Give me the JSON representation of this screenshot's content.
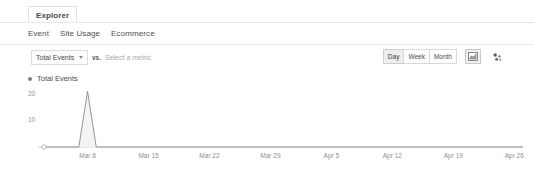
{
  "panel": {
    "main_tab": "Explorer"
  },
  "subtabs": [
    {
      "label": "Event"
    },
    {
      "label": "Site Usage"
    },
    {
      "label": "Ecommerce"
    }
  ],
  "controls": {
    "metric_select_value": "Total Events",
    "vs_label": "vs.",
    "compare_placeholder": "Select a metric",
    "granularity": [
      {
        "label": "Day",
        "active": true
      },
      {
        "label": "Week",
        "active": false
      },
      {
        "label": "Month",
        "active": false
      }
    ],
    "view_icons": [
      {
        "name": "line-chart-icon",
        "active": true
      },
      {
        "name": "motion-chart-icon",
        "active": false
      }
    ]
  },
  "legend": {
    "series_label": "Total Events",
    "dot_color": "#7d7d7d"
  },
  "chart_data": {
    "type": "line",
    "title": "Total Events",
    "xlabel": "",
    "ylabel": "",
    "grid": false,
    "legend_position": "top-left",
    "series": [
      {
        "name": "Total Events",
        "color": "#8a8a8a",
        "fill": "#f4f4f4",
        "values": [
          0,
          0,
          0,
          0,
          0,
          21,
          0,
          0,
          0,
          0,
          0,
          0,
          0,
          0,
          0,
          0,
          0,
          0,
          0,
          0,
          0,
          0,
          0,
          0,
          0,
          0,
          0,
          0,
          0,
          0,
          0,
          0,
          0,
          0,
          0,
          0,
          0,
          0,
          0,
          0,
          0,
          0,
          0,
          0,
          0,
          0,
          0,
          0,
          0,
          0,
          0,
          0,
          0,
          0,
          0,
          0
        ]
      }
    ],
    "x_ticks": [
      {
        "label": "Mar 8",
        "index": 5
      },
      {
        "label": "Mar 15",
        "index": 12
      },
      {
        "label": "Mar 22",
        "index": 19
      },
      {
        "label": "Mar 29",
        "index": 26
      },
      {
        "label": "Apr 5",
        "index": 33
      },
      {
        "label": "Apr 12",
        "index": 40
      },
      {
        "label": "Apr 19",
        "index": 47
      },
      {
        "label": "Apr 26",
        "index": 54
      }
    ],
    "y_ticks": [
      {
        "label": "20",
        "value": 20
      },
      {
        "label": "10",
        "value": 10
      }
    ],
    "ylim": [
      0,
      23
    ],
    "marker_at_origin": true
  }
}
